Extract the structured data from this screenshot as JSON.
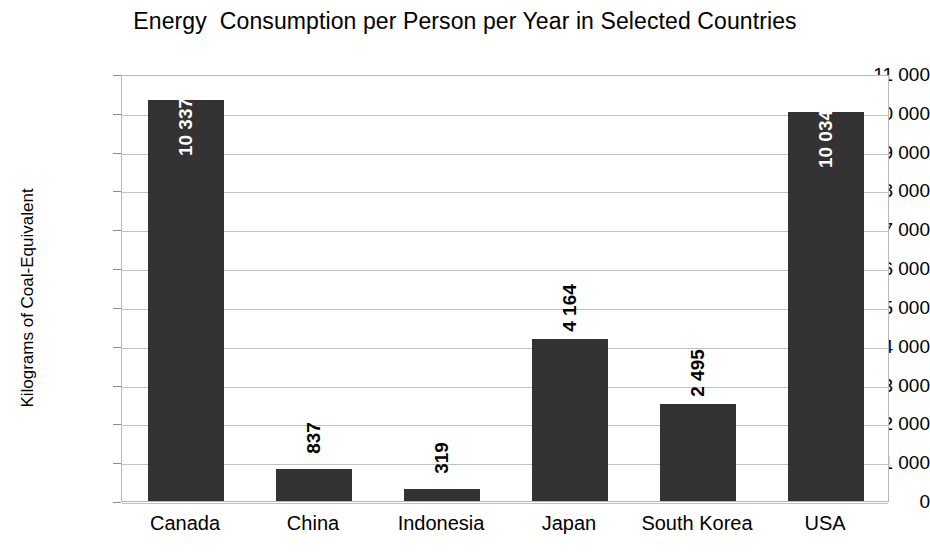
{
  "chart_data": {
    "type": "bar",
    "title": "Energy  Consumption per Person per Year in Selected Countries",
    "xlabel": "",
    "ylabel": "Kilograms of Coal-Equivalent",
    "categories": [
      "Canada",
      "China",
      "Indonesia",
      "Japan",
      "South Korea",
      "USA"
    ],
    "values": [
      10337,
      837,
      319,
      4164,
      2495,
      10034
    ],
    "value_labels": [
      "10 337",
      "837",
      "319",
      "4 164",
      "2 495",
      "10 034"
    ],
    "label_placement": [
      "inside",
      "outside",
      "outside",
      "outside",
      "outside",
      "inside"
    ],
    "ylim": [
      0,
      11000
    ],
    "ytick_values": [
      0,
      1000,
      2000,
      3000,
      4000,
      5000,
      6000,
      7000,
      8000,
      9000,
      10000,
      11000
    ],
    "ytick_labels": [
      "0",
      "1 000",
      "2 000",
      "3 000",
      "4 000",
      "5 000",
      "6 000",
      "7 000",
      "8 000",
      "9 000",
      "10 000",
      "11 000"
    ],
    "grid": true,
    "legend": false,
    "bar_color": "#333333",
    "grid_color": "#c2c2c2",
    "plot_border_color": "#b9b9b9",
    "background_color": "#ffffff",
    "inside_label_color": "#ffffff",
    "outside_label_color": "#000000",
    "value_label_rotation": -90
  }
}
